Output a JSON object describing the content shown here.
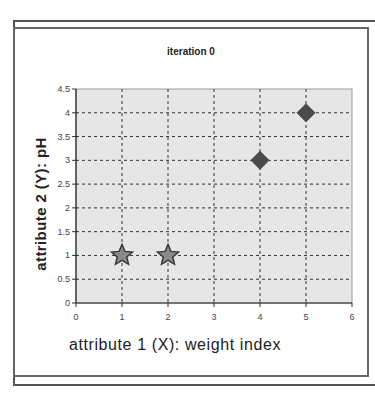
{
  "chart_data": {
    "type": "scatter",
    "title": "iteration 0",
    "xlabel": "attribute 1 (X): weight index",
    "ylabel": "attribute 2 (Y): pH",
    "xlim": [
      0,
      6
    ],
    "ylim": [
      0,
      4.5
    ],
    "x_ticks": [
      "0",
      "1",
      "2",
      "3",
      "4",
      "5",
      "6"
    ],
    "y_ticks": [
      "0",
      "0.5",
      "1",
      "1.5",
      "2",
      "2.5",
      "3",
      "3.5",
      "4",
      "4.5"
    ],
    "grid": true,
    "series": [
      {
        "name": "stars",
        "marker": "star",
        "color": "#8a8a8a",
        "points": [
          [
            1,
            1
          ],
          [
            2,
            1
          ]
        ]
      },
      {
        "name": "diamonds",
        "marker": "diamond",
        "color": "#4a4a4a",
        "points": [
          [
            4,
            3
          ],
          [
            5,
            4
          ]
        ]
      }
    ],
    "plot_background": "#e6e6e6"
  }
}
